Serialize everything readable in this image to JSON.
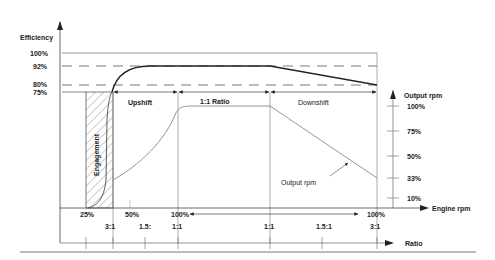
{
  "diagram": {
    "type": "clutch-efficiency-vs-engine-rpm",
    "left_axis": {
      "title": "Efficiency",
      "ticks": [
        "100%",
        "92%",
        "80%",
        "75%"
      ]
    },
    "right_axis": {
      "title": "Output  rpm",
      "ticks": [
        "100%",
        "75%",
        "50%",
        "33%",
        "10%"
      ]
    },
    "bottom_axis_engine": {
      "title": "Engine  rpm",
      "ticks": [
        "25%",
        "50%",
        "100%",
        "100%"
      ]
    },
    "bottom_axis_ratio": {
      "title": "Ratio",
      "ticks": [
        "3:1",
        "1.5:",
        "1:1",
        "1:1",
        "1.5:1",
        "3:1"
      ]
    },
    "regions": {
      "engagement": "Engagement",
      "upshift": "Upshift",
      "ratio_1_1": "1:1  Ratio",
      "downshift": "Downshift"
    },
    "annotations": {
      "output_rpm": "Output  rpm"
    },
    "colors": {
      "line": "#333333",
      "thin_line": "#777777",
      "text": "#222222",
      "background": "#ffffff"
    }
  }
}
